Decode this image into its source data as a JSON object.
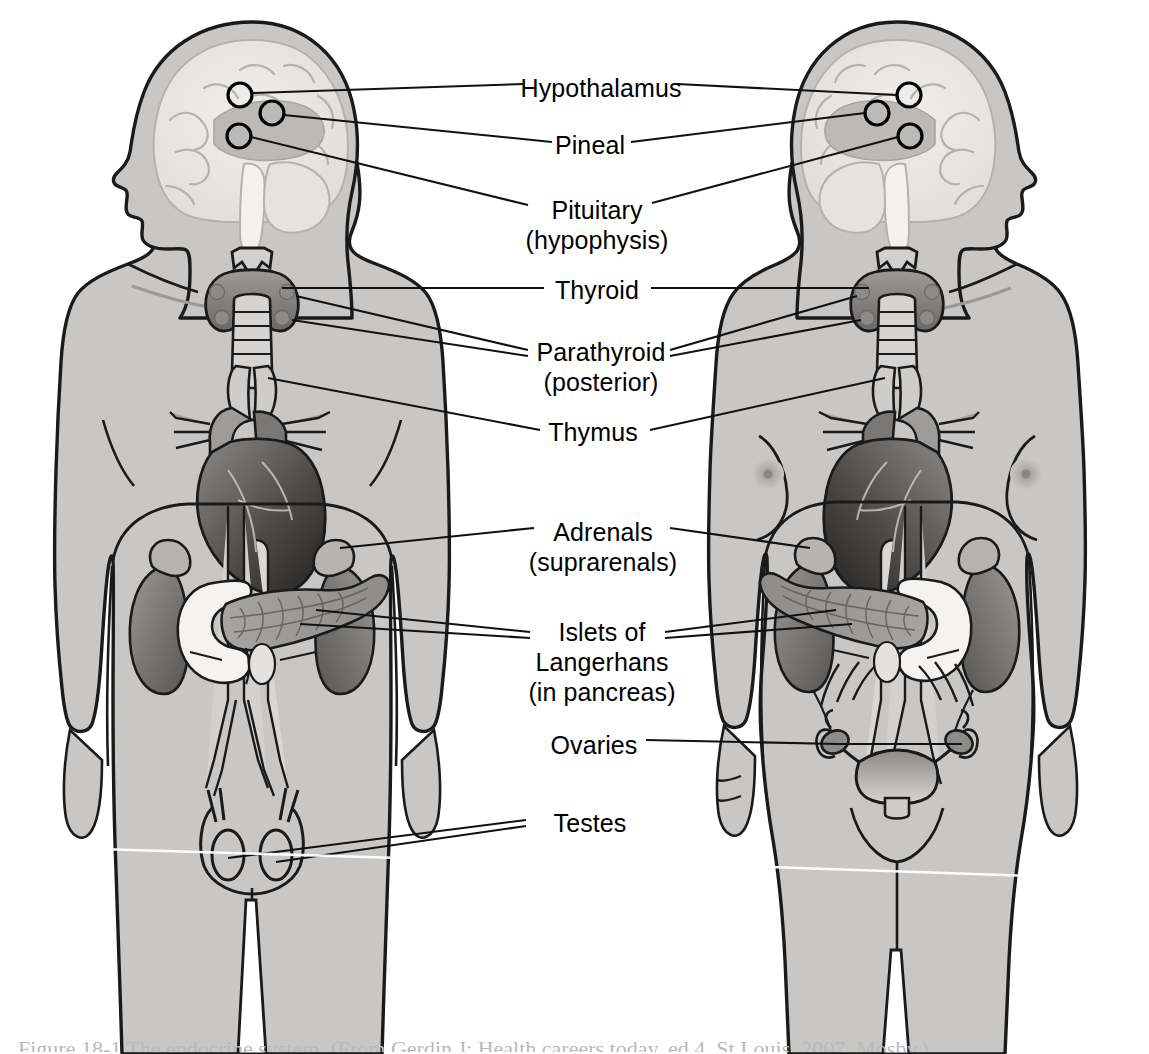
{
  "figure": {
    "background_color": "#ffffff",
    "body_fill_color": "#c9c7c5",
    "outline_color": "#1a1a1a",
    "organ_dark_color": "#6e6c6a",
    "organ_light_color": "#e8e7e5",
    "label_color": "#000000",
    "caption_text": "Figure 18-1  The endocrine system. (From Gerdin J: Health careers today, ed 4, St Louis, 2007, Mosby.)"
  },
  "labels": [
    {
      "id": "hypothalamus",
      "text": "Hypothalamus",
      "x": 601,
      "y": 73
    },
    {
      "id": "pineal",
      "text": "Pineal",
      "x": 590,
      "y": 130
    },
    {
      "id": "pituitary",
      "text": "Pituitary\n(hypophysis)",
      "x": 597,
      "y": 195
    },
    {
      "id": "thyroid",
      "text": "Thyroid",
      "x": 597,
      "y": 275
    },
    {
      "id": "parathyroid",
      "text": "Parathyroid\n(posterior)",
      "x": 601,
      "y": 337
    },
    {
      "id": "thymus",
      "text": "Thymus",
      "x": 593,
      "y": 417
    },
    {
      "id": "adrenals",
      "text": "Adrenals\n(supra",
      "text_full": "Adrenals\n(suprarenals)",
      "x": 603,
      "y": 517
    },
    {
      "id": "islets",
      "text": "Islets of\nLangerhans\n(in pancreas)",
      "x": 602,
      "y": 617
    },
    {
      "id": "ovaries",
      "text": "Ovaries",
      "x": 594,
      "y": 730
    },
    {
      "id": "testes",
      "text": "Testes",
      "x": 590,
      "y": 808
    }
  ],
  "figures": [
    {
      "id": "male-figure",
      "name": "Male figure",
      "side": "left",
      "facing": "left",
      "organs": [
        "hypothalamus",
        "pineal",
        "pituitary",
        "thyroid",
        "parathyroid",
        "thymus",
        "heart",
        "adrenals",
        "kidneys",
        "pancreas",
        "testes"
      ]
    },
    {
      "id": "female-figure",
      "name": "Female figure",
      "side": "right",
      "facing": "right",
      "organs": [
        "hypothalamus",
        "pineal",
        "pituitary",
        "thyroid",
        "parathyroid",
        "thymus",
        "heart",
        "adrenals",
        "kidneys",
        "pancreas",
        "ovaries",
        "uterus"
      ]
    }
  ]
}
